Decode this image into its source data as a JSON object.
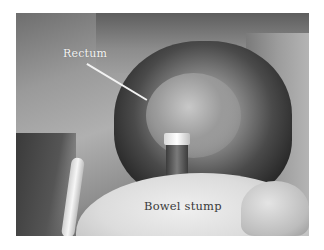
{
  "figure": {
    "type": "surgical-photograph",
    "color_mode": "grayscale",
    "labels": {
      "rectum": "Rectum",
      "bowel_stump": "Bowel stump"
    },
    "colors": {
      "background": "#ffffff",
      "rectum_label": "#f4f4f4",
      "bowel_stump_label": "#3a3a3a"
    }
  }
}
